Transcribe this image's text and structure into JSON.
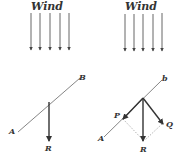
{
  "panels": [
    {
      "id": "left",
      "title": "Wind",
      "labels": {
        "a": "A",
        "b": "B",
        "r": "R"
      }
    },
    {
      "id": "right",
      "title": "Wind",
      "labels": {
        "a": "A",
        "b": "b",
        "p": "P",
        "q": "Q",
        "r": "R"
      }
    }
  ],
  "colors": {
    "ink": "#333333",
    "line": "#777777",
    "dotted": "#aaaaaa"
  }
}
